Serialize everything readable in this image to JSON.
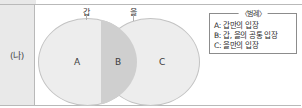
{
  "diagram": {
    "type": "venn",
    "row_header": "(나)",
    "circles": [
      {
        "id": "left",
        "label": "갑"
      },
      {
        "id": "right",
        "label": "을"
      }
    ],
    "regions": [
      {
        "id": "A",
        "label": "A"
      },
      {
        "id": "B",
        "label": "B"
      },
      {
        "id": "C",
        "label": "C"
      }
    ],
    "legend": {
      "title": "〈범례〉",
      "items": [
        {
          "key": "A:",
          "text": "갑만의 입장"
        },
        {
          "key": "B:",
          "text": "갑, 을의 공통 입장"
        },
        {
          "key": "C:",
          "text": "을만의 입장"
        }
      ]
    },
    "colors": {
      "circle_fill": "#ededed",
      "overlap_fill": "#cfcfcf",
      "circle_stroke": "#c3c3c3",
      "header_fill": "#e9e9e9",
      "frame_stroke": "#b9b9b9",
      "legend_stroke": "#8c8c8c"
    }
  }
}
